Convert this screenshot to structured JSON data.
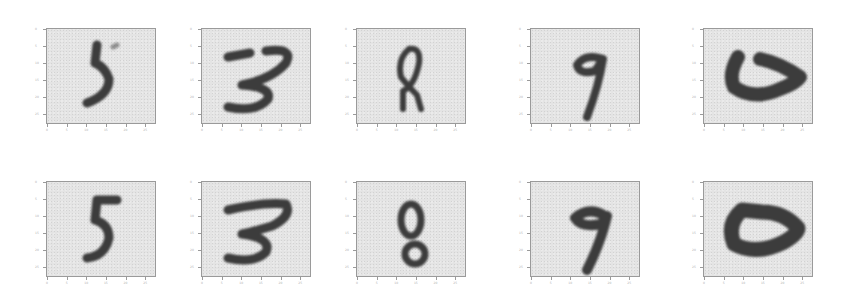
{
  "figure": {
    "rows": [
      {
        "row": "top",
        "panels": [
          {
            "digit": "5"
          },
          {
            "digit": "3"
          },
          {
            "digit": "8"
          },
          {
            "digit": "9"
          },
          {
            "digit": "0"
          }
        ]
      },
      {
        "row": "bottom",
        "panels": [
          {
            "digit": "5"
          },
          {
            "digit": "3"
          },
          {
            "digit": "8"
          },
          {
            "digit": "9"
          },
          {
            "digit": "0"
          }
        ]
      }
    ],
    "axis_ticks": [
      "0",
      "5",
      "10",
      "15",
      "20",
      "25"
    ],
    "colors": {
      "background": "#ffffff",
      "panel_background": "#e4e4e4",
      "stroke": "#3c3c3c",
      "frame": "#9a9a9a"
    }
  }
}
